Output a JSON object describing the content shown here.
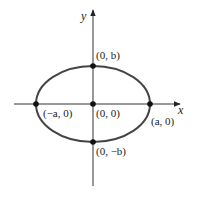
{
  "axes": {
    "x_label": "x",
    "y_label": "y"
  },
  "points": {
    "top": "(0, b)",
    "bottom": "(0, −b)",
    "left": "(−a, 0)",
    "right": "(a, 0)",
    "center": "(0, 0)"
  },
  "colors": {
    "curve": "#444444",
    "axis": "#333333",
    "point": "#111111"
  }
}
